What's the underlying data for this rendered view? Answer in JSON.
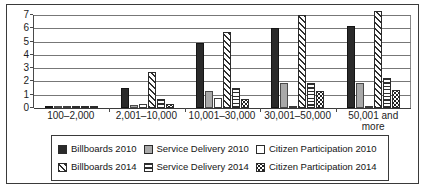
{
  "chart_data": {
    "type": "bar",
    "title": "",
    "subtitle": "",
    "xlabel": "",
    "ylabel": "",
    "ylim": [
      0,
      7
    ],
    "yticks": [
      "0",
      "1",
      "2",
      "3",
      "4",
      "5",
      "6",
      "7"
    ],
    "grid": true,
    "legend_position": "bottom",
    "categories": [
      "100–2,000",
      "2,001–10,000",
      "10,001–30,000",
      "30,001–50,000",
      "50,001 and more"
    ],
    "series": [
      {
        "name": "Billboards 2010",
        "pattern": "solid-black",
        "values": [
          0.15,
          1.5,
          4.9,
          6.0,
          6.2
        ]
      },
      {
        "name": "Service Delivery 2010",
        "pattern": "solid-gray",
        "values": [
          0.03,
          0.25,
          1.3,
          1.9,
          1.85
        ]
      },
      {
        "name": "Citizen Participation 2010",
        "pattern": "solid-white",
        "values": [
          0.02,
          0.3,
          0.75,
          0.05,
          0.05
        ]
      },
      {
        "name": "Billboards 2014",
        "pattern": "diagonal-hatch",
        "values": [
          0.12,
          2.7,
          5.7,
          7.0,
          7.3
        ]
      },
      {
        "name": "Service Delivery 2014",
        "pattern": "horizontal-lines",
        "values": [
          0.05,
          0.7,
          1.5,
          1.9,
          2.25
        ]
      },
      {
        "name": "Citizen Participation 2014",
        "pattern": "dotted-checker",
        "values": [
          0.04,
          0.3,
          0.7,
          1.3,
          1.35
        ]
      }
    ]
  },
  "legend": {
    "rows": [
      [
        {
          "label": "Billboards 2010",
          "swatch": "solid-black-swatch"
        },
        {
          "label": "Service Delivery 2010",
          "swatch": "solid-gray-swatch"
        },
        {
          "label": "Citizen Participation 2010",
          "swatch": "solid-white-swatch"
        }
      ],
      [
        {
          "label": "Billboards 2014",
          "swatch": "diagonal-hatch-swatch"
        },
        {
          "label": "Service Delivery 2014",
          "swatch": "horizontal-lines-swatch"
        },
        {
          "label": "Citizen Participation 2014",
          "swatch": "dotted-checker-swatch"
        }
      ]
    ]
  },
  "colors": {
    "series_2010_billboards": "#2a2a2a",
    "series_2010_service": "#a9a9a9",
    "series_2010_citizen": "#ffffff",
    "gridline": "#777777",
    "axis": "#3a3a3a",
    "frame": "#3a3a3a"
  }
}
